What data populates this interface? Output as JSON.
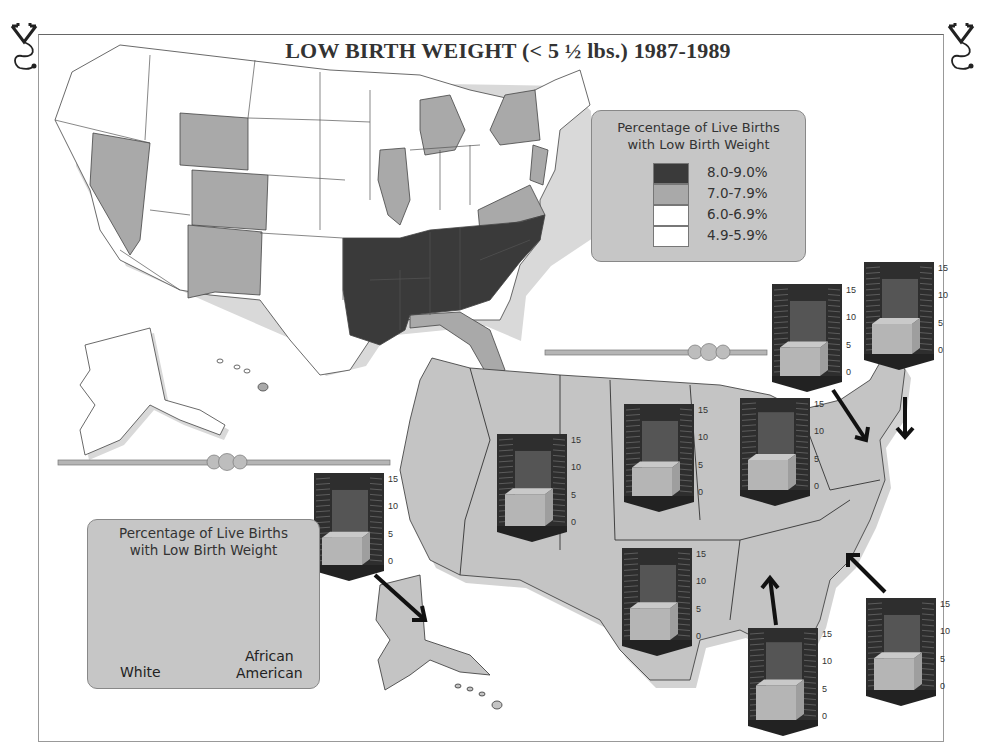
{
  "title": "LOW BIRTH WEIGHT (< 5 ½ lbs.) 1987-1989",
  "icons": {
    "left": "stethoscope-icon",
    "right": "stethoscope-icon"
  },
  "legend_state_map": {
    "title_line1": "Percentage of Live Births",
    "title_line2": "with Low Birth Weight",
    "items": [
      {
        "label": "8.0-9.0%",
        "color": "#3a3a3a"
      },
      {
        "label": "7.0-7.9%",
        "color": "#a9a9a9"
      },
      {
        "label": "6.0-6.9%",
        "color": "#ffffff"
      },
      {
        "label": "4.9-5.9%",
        "color": "#ffffff"
      }
    ]
  },
  "legend_regional": {
    "title_line1": "Percentage of Live Births",
    "title_line2": "with Low Birth Weight",
    "label_white": "White",
    "label_aa_line1": "African",
    "label_aa_line2": "American"
  },
  "colors": {
    "dark": "#3a3a3a",
    "medium": "#a9a9a9",
    "light": "#ffffff",
    "region_fill": "#c4c4c4",
    "chart_back": "#2e2e2e",
    "chart_aa": "#555555",
    "chart_white": "#b5b5b5"
  },
  "chart_data": {
    "type": "bar",
    "ylim": [
      0,
      15
    ],
    "yticks": [
      "0",
      "5",
      "10",
      "15"
    ],
    "series_names": [
      "White",
      "African American"
    ],
    "regions": [
      {
        "name": "Legend example",
        "white": 5.5,
        "african_american": 13
      },
      {
        "name": "Pacific (Alaska arrow)",
        "white": 5.0,
        "african_american": 13
      },
      {
        "name": "Mountain",
        "white": 5.8,
        "african_american": 13
      },
      {
        "name": "West North Central",
        "white": 5.2,
        "african_american": 13
      },
      {
        "name": "East North Central",
        "white": 5.5,
        "african_american": 13.5
      },
      {
        "name": "Middle Atlantic",
        "white": 5.2,
        "african_american": 13
      },
      {
        "name": "New England",
        "white": 5.5,
        "african_american": 13
      },
      {
        "name": "West South Central",
        "white": 5.8,
        "african_american": 13
      },
      {
        "name": "East South Central",
        "white": 6.3,
        "african_american": 13.5
      },
      {
        "name": "South Atlantic",
        "white": 5.8,
        "african_american": 13
      }
    ]
  }
}
